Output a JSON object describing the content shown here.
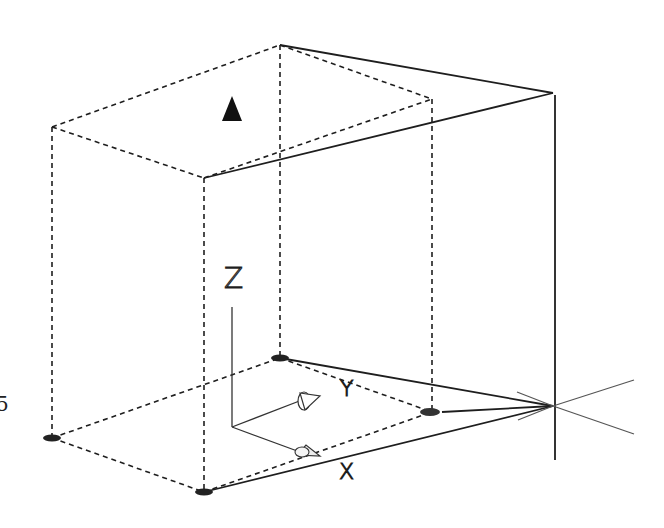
{
  "figure": {
    "margin_fragment": "5",
    "axes": {
      "z_label": "Z",
      "y_label": "Y",
      "x_label": "X"
    },
    "markers": {
      "target_marker": "filled-triangle",
      "vanishing_point": "crosshair"
    },
    "colors": {
      "line": "#1e1e1e",
      "background": "#ffffff"
    }
  }
}
